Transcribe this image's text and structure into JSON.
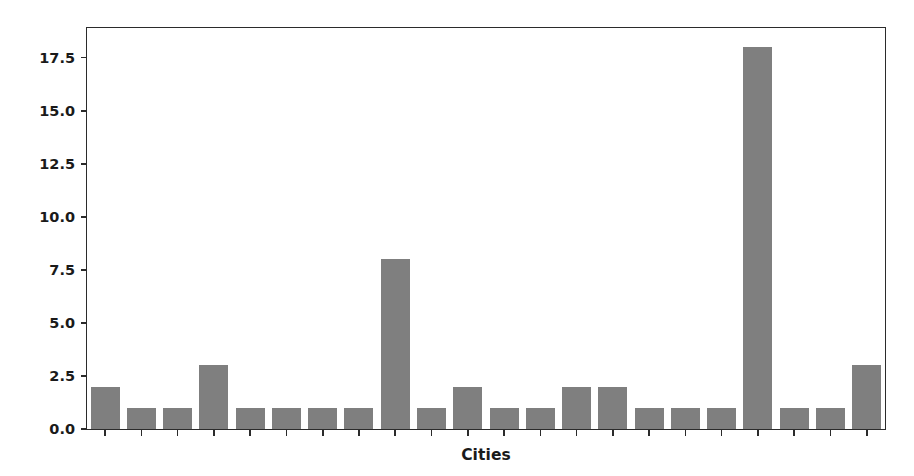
{
  "chart_data": {
    "type": "bar",
    "title": "",
    "xlabel": "Cities",
    "ylabel": "store count",
    "categories": [
      "1",
      "2",
      "3",
      "4",
      "5",
      "6",
      "7",
      "8",
      "9",
      "10",
      "11",
      "12",
      "13",
      "14",
      "15",
      "16",
      "17",
      "18",
      "19",
      "20",
      "21",
      "22"
    ],
    "values": [
      2,
      1,
      1,
      3,
      1,
      1,
      1,
      1,
      8,
      1,
      2,
      1,
      1,
      2,
      2,
      1,
      1,
      1,
      18,
      1,
      1,
      3
    ],
    "ylim": [
      0,
      18.9
    ],
    "yticks": [
      0.0,
      2.5,
      5.0,
      7.5,
      10.0,
      12.5,
      15.0,
      17.5
    ],
    "ytick_labels": [
      "0.0",
      "2.5",
      "5.0",
      "7.5",
      "10.0",
      "12.5",
      "15.0",
      "17.5"
    ],
    "grid": false,
    "legend": null,
    "bar_color": "#7f7f7f",
    "axis_color": "#2b2b2b",
    "background": "#ffffff"
  }
}
